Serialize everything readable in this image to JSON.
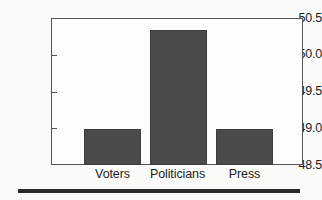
{
  "chart_data": {
    "type": "bar",
    "title": "",
    "subtitle": "",
    "xlabel": "",
    "ylabel": "",
    "categories": [
      "Voters",
      "Politicians",
      "Press"
    ],
    "values": [
      49.0,
      50.37,
      49.0
    ],
    "series": [
      {
        "name": "",
        "values": [
          49.0,
          50.37,
          49.0
        ]
      }
    ],
    "ylim": [
      48.5,
      50.5
    ],
    "yticks": [
      48.5,
      49.0,
      49.5,
      50.0,
      50.5
    ],
    "ytick_labels": [
      "48.5",
      "49.0",
      "49.5",
      "50.0",
      "50.5"
    ],
    "xtick_labels": [
      "Voters",
      "Politicians",
      "Press"
    ],
    "grid": false,
    "legend": null,
    "legend_position": "none",
    "annotations": [],
    "bar_color": "#4a4a4a",
    "frame_color": "#555555",
    "background_color": "#fdfdfc"
  },
  "figure": {
    "separator_color": "#2a2a2a"
  }
}
